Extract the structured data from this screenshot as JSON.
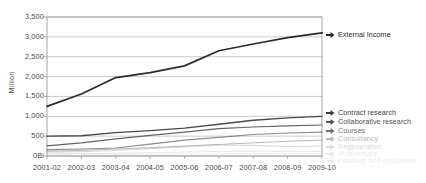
{
  "chart_data": {
    "type": "line",
    "title": "",
    "subtitle": "",
    "xlabel": "",
    "ylabel": "Million",
    "grid": true,
    "legend_position": "right",
    "ylim": [
      0,
      3500
    ],
    "ytick_labels": [
      "3,500",
      "3,000",
      "2,500",
      "2,000",
      "1,500",
      "1,000",
      "500",
      "0Bi"
    ],
    "ytick_values": [
      3500,
      3000,
      2500,
      2000,
      1500,
      1000,
      500,
      0
    ],
    "categories": [
      "2001-02",
      "2002-03",
      "2003-04",
      "2004-05",
      "2005-06",
      "2006-07",
      "2007-08",
      "2008-09",
      "2009-10"
    ],
    "series": [
      {
        "name": "External Income",
        "color": "#2b2b2b",
        "opacity": 1.0,
        "width": 1.7,
        "values": [
          1250,
          1560,
          1975,
          2100,
          2270,
          2650,
          2820,
          2980,
          3100
        ]
      },
      {
        "name": "Contract research",
        "color": "#3a3a3a",
        "opacity": 0.92,
        "width": 1.3,
        "values": [
          500,
          510,
          590,
          640,
          700,
          800,
          900,
          960,
          1000
        ]
      },
      {
        "name": "Collaborative research",
        "color": "#4a4a4a",
        "opacity": 0.85,
        "width": 1.2,
        "values": [
          255,
          330,
          430,
          520,
          600,
          690,
          730,
          760,
          780
        ]
      },
      {
        "name": "Courses",
        "color": "#5c5c5c",
        "opacity": 0.7,
        "width": 1.1,
        "values": [
          160,
          175,
          200,
          300,
          400,
          470,
          540,
          580,
          600
        ]
      },
      {
        "name": "Consultancy",
        "color": "#7a7a7a",
        "opacity": 0.55,
        "width": 1.0,
        "values": [
          120,
          140,
          175,
          210,
          250,
          290,
          330,
          370,
          400
        ]
      },
      {
        "name": "Regeneration",
        "color": "#9a9a9a",
        "opacity": 0.4,
        "width": 1.0,
        "values": [
          95,
          110,
          140,
          185,
          230,
          275,
          265,
          240,
          250
        ]
      },
      {
        "name": "IP revenues",
        "color": "#b0b0b0",
        "opacity": 0.32,
        "width": 1.0,
        "values": [
          55,
          60,
          70,
          85,
          100,
          115,
          120,
          120,
          120
        ]
      },
      {
        "name": "Facilities and equipment",
        "color": "#bdbdbd",
        "opacity": 0.26,
        "width": 1.0,
        "values": [
          25,
          28,
          32,
          38,
          45,
          52,
          58,
          62,
          65
        ]
      }
    ]
  },
  "legend": {
    "items": [
      {
        "label": "External Income",
        "marker": "arrow-right-icon",
        "color": "#262626",
        "opacity": 1.0
      },
      {
        "label": "Contract research",
        "marker": "arrow-right-icon",
        "color": "#333333",
        "opacity": 0.95
      },
      {
        "label": "Collaborative research",
        "marker": "arrow-right-icon",
        "color": "#3d3d3d",
        "opacity": 0.9
      },
      {
        "label": "Courses",
        "marker": "arrow-right-icon",
        "color": "#4d4d4d",
        "opacity": 0.82
      },
      {
        "label": "Consultancy",
        "marker": "arrow-right-icon",
        "color": "#8a8a8a",
        "opacity": 0.6
      },
      {
        "label": "Regeneration",
        "marker": "arrow-right-icon",
        "color": "#a8a8a8",
        "opacity": 0.42
      },
      {
        "label": "IP revenues",
        "marker": "arrow-right-icon",
        "color": "#b8b8b8",
        "opacity": 0.32
      },
      {
        "label": "Facilities and equipment",
        "marker": "arrow-right-icon",
        "color": "#c0c0c0",
        "opacity": 0.3
      }
    ]
  },
  "colors": {
    "plot_border": "#8f8f8f",
    "gridline": "#b4b4b4",
    "axis_text": "#4a4a4a",
    "background": "#ffffff"
  }
}
